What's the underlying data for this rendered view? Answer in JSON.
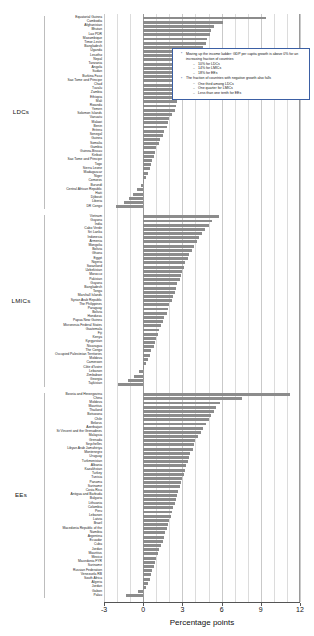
{
  "chart_data": {
    "type": "bar",
    "orientation": "horizontal",
    "title": "",
    "xlabel": "Percentage points",
    "ylabel": "",
    "xlim": [
      -3,
      12
    ],
    "xticks": [
      -3,
      0,
      3,
      6,
      9,
      12
    ],
    "gridlines": [
      -3,
      -2,
      -1,
      0,
      1,
      2,
      3,
      4,
      5,
      6,
      7,
      8,
      9,
      10,
      11,
      12
    ],
    "grid": true,
    "legend": "none",
    "bar_color": "#8c8c8c",
    "groups": [
      {
        "name": "LDCs",
        "categories": [
          "Equatorial Guinea",
          "Cambodia",
          "Afghanistan",
          "Bhutan",
          "Lao PDR",
          "Mozambique",
          "Timor-Leste",
          "Bangladesh",
          "Uganda",
          "Lesotho",
          "Nepal",
          "Tanzania",
          "Angola",
          "Sudan",
          "Burkina Faso",
          "Sao Tome and Principe",
          "Chad",
          "Tuvalu",
          "Zambia",
          "Ethiopia",
          "Mali",
          "Rwanda",
          "Yemen",
          "Solomon Islands",
          "Vanuatu",
          "Malawi",
          "Benin",
          "Eritrea",
          "Senegal",
          "Guinea",
          "Somalia",
          "Gambia",
          "Guinea-Bissau",
          "Kiribati",
          "Sao Tome and Principe II",
          "Togo",
          "Sierra Leone",
          "Madagascar",
          "Niger",
          "Comoros",
          "Burundi",
          "Central African Republic",
          "Haiti",
          "Djibouti",
          "Liberia",
          "DR Congo"
        ],
        "values": [
          9.4,
          6.1,
          5.4,
          5.2,
          5.1,
          4.9,
          4.8,
          4.6,
          4.4,
          4.3,
          4.2,
          4.0,
          3.8,
          3.6,
          3.5,
          3.3,
          3.2,
          3.0,
          2.8,
          2.7,
          2.6,
          2.5,
          2.4,
          2.2,
          2.0,
          1.9,
          1.8,
          1.6,
          1.5,
          1.3,
          1.2,
          1.0,
          0.9,
          0.8,
          0.7,
          0.6,
          0.5,
          0.35,
          0.2,
          0.1,
          -0.2,
          -0.5,
          -0.8,
          -1.1,
          -1.5,
          -2.1
        ]
      },
      {
        "name": "LMICs",
        "categories": [
          "Vietnam",
          "Guyana",
          "India",
          "Cabo Verde",
          "Sri Lanka",
          "Indonesia",
          "Armenia",
          "Mongolia",
          "Bolivia",
          "Ghana",
          "Egypt",
          "Nigeria",
          "Swaziland",
          "Uzbekistan",
          "Morocco",
          "Pakistan",
          "Guyana II",
          "Bangladesh II",
          "Tonga",
          "Marshall Islands",
          "Syrian Arab Republic",
          "The Philippines",
          "Paraguay",
          "Bolivia II",
          "Honduras",
          "Papua New Guinea",
          "Micronesia Federal States",
          "Guatemala",
          "Fiji",
          "Kenya",
          "Kyrgyzstan",
          "Nicaragua",
          "The Congo",
          "Occupied Palestinian Territories",
          "Moldova",
          "Cameroon",
          "Côte d'Ivoire",
          "Lebanon",
          "Zimbabwe",
          "Georgia",
          "Tajikistan"
        ],
        "values": [
          5.8,
          5.3,
          5.0,
          4.7,
          4.5,
          4.3,
          4.1,
          3.9,
          3.7,
          3.5,
          3.4,
          3.2,
          3.1,
          3.0,
          2.9,
          2.8,
          2.6,
          2.5,
          2.4,
          2.3,
          2.2,
          2.0,
          1.9,
          1.8,
          1.6,
          1.5,
          1.4,
          1.2,
          1.1,
          1.0,
          0.9,
          0.8,
          0.6,
          0.5,
          0.4,
          0.25,
          0.1,
          -0.3,
          -0.7,
          -1.2,
          -1.9
        ]
      },
      {
        "name": "EEs",
        "categories": [
          "Bosnia and Herzegovina",
          "China",
          "Moldova",
          "Mauritius",
          "Thailand",
          "Botswana",
          "Chile",
          "Belarus",
          "Azerbaijan",
          "St Vincent and the Grenadines",
          "Malaysia",
          "Grenada",
          "Seychelles",
          "Libyan Arab Jamahiriya",
          "Montenegro",
          "Uruguay",
          "Turkmenistan",
          "Albania",
          "Kazakhstan",
          "Turkey",
          "Tunisia",
          "Panama",
          "Suriname",
          "Costa Rica",
          "Antigua and Barbuda",
          "Bulgaria",
          "Lithuania",
          "Colombia",
          "Peru",
          "Lebanon II",
          "Latvia",
          "Brazil",
          "Macedonia Republic of the",
          "Namibia",
          "Argentina",
          "Ecuador",
          "Cuba",
          "Jordan",
          "Mauritius II",
          "Mexico",
          "Macedonia FYR",
          "Suriname II",
          "Russian Federation",
          "Venezuela RB",
          "South Africa",
          "Algeria",
          "Jordan II",
          "Gabon",
          "Palau"
        ],
        "values": [
          11.2,
          7.6,
          5.9,
          5.6,
          5.4,
          5.2,
          5.0,
          4.8,
          4.6,
          4.4,
          4.2,
          4.0,
          3.9,
          3.8,
          3.6,
          3.5,
          3.4,
          3.3,
          3.2,
          3.1,
          3.0,
          2.9,
          2.8,
          2.7,
          2.6,
          2.5,
          2.4,
          2.3,
          2.2,
          2.1,
          2.0,
          1.9,
          1.8,
          1.7,
          1.6,
          1.5,
          1.4,
          1.2,
          1.1,
          1.0,
          0.9,
          0.8,
          0.7,
          0.6,
          0.5,
          0.35,
          0.2,
          -0.4,
          -1.3
        ]
      }
    ]
  },
  "annotation": {
    "bullets": [
      {
        "text": "Moving up the income ladder: GDP per capita growth is above 0% for an increasing fraction of countries",
        "sub": [
          "10% for LDCs",
          "14% for LMICs",
          "18% for EEs"
        ]
      },
      {
        "text": "The fraction of countries with negative growth also falls",
        "sub": [
          "One third among LDCs",
          "One quarter for LMICs",
          "Less than one tenth for EEs"
        ]
      }
    ],
    "border_color": "#3b5fa4"
  }
}
